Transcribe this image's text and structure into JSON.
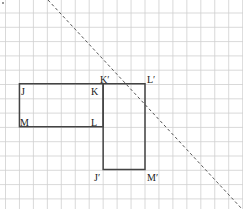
{
  "diagram": {
    "type": "grid-reflection",
    "grid": {
      "columns": 17,
      "rows": 14
    },
    "colors": {
      "grid": "#cfcfcf",
      "shape": "#444444",
      "mirror_line": "#555555",
      "background": "#ffffff"
    },
    "original_rectangle": {
      "name": "JKLM",
      "vertices": [
        {
          "label": "J",
          "col": 1,
          "row": 5
        },
        {
          "label": "K",
          "col": 7,
          "row": 5
        },
        {
          "label": "L",
          "col": 7,
          "row": 8
        },
        {
          "label": "M",
          "col": 1,
          "row": 8
        }
      ]
    },
    "image_rectangle": {
      "name": "J'K'L'M'",
      "vertices": [
        {
          "label": "K′",
          "col": 7,
          "row": 5
        },
        {
          "label": "L′",
          "col": 10,
          "row": 5
        },
        {
          "label": "M′",
          "col": 10,
          "row": 11
        },
        {
          "label": "J′",
          "col": 7,
          "row": 11
        }
      ]
    },
    "mirror_line": {
      "style": "dashed",
      "direction": "diagonal top-left to bottom-right"
    }
  }
}
